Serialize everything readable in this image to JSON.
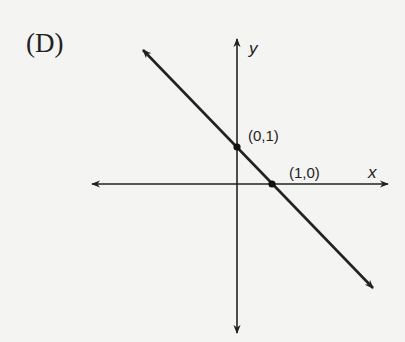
{
  "figure": {
    "choice_label": "(D)",
    "axes": {
      "x_label": "x",
      "y_label": "y"
    },
    "points": [
      {
        "label": "(0,1)",
        "x": 0,
        "y": 1
      },
      {
        "label": "(1,0)",
        "x": 1,
        "y": 0
      }
    ],
    "line": {
      "description": "Line through (0,1) and (1,0), slope -1",
      "equation": "y = -x + 1"
    },
    "colors": {
      "ink": "#222222",
      "background": "#f4f4f3"
    }
  }
}
